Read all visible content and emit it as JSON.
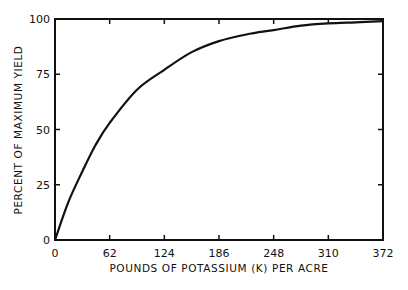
{
  "chart_data": {
    "type": "line",
    "title": "",
    "xlabel": "POUNDS OF POTASSIUM (K) PER ACRE",
    "ylabel": "PERCENT OF MAXIMUM YIELD",
    "xlim": [
      0,
      372
    ],
    "ylim": [
      0,
      100
    ],
    "xticks": [
      0,
      62,
      124,
      186,
      248,
      310,
      372
    ],
    "yticks": [
      0,
      25,
      50,
      75,
      100
    ],
    "grid": false,
    "legend": null,
    "series": [
      {
        "name": "yield response",
        "x": [
          0,
          15,
          31,
          46,
          62,
          93,
          124,
          155,
          186,
          217,
          248,
          279,
          310,
          341,
          372
        ],
        "y": [
          0,
          17,
          31,
          43,
          53,
          68,
          77,
          85,
          90,
          93,
          95,
          97,
          98,
          98.5,
          99
        ]
      }
    ]
  },
  "axes": {
    "x_tick_labels": [
      "0",
      "62",
      "124",
      "186",
      "248",
      "310",
      "372"
    ],
    "y_tick_labels": [
      "0",
      "25",
      "50",
      "75",
      "100"
    ],
    "xlabel": "POUNDS OF POTASSIUM (K) PER ACRE",
    "ylabel": "PERCENT OF MAXIMUM YIELD"
  }
}
